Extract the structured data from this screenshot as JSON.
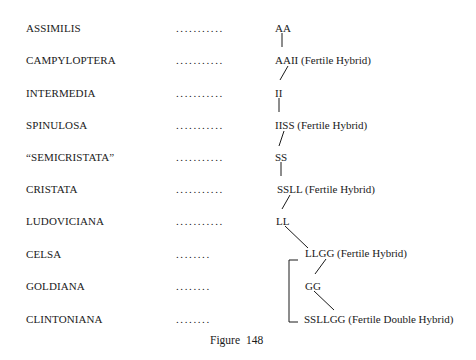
{
  "diagram": {
    "rows": [
      {
        "species": "ASSIMILIS",
        "dots": "...........",
        "genome": "AA"
      },
      {
        "species": "CAMPYLOPTERA",
        "dots": "...........",
        "genome": "AAII (Fertile Hybrid)"
      },
      {
        "species": "INTERMEDIA",
        "dots": "...........",
        "genome": "II"
      },
      {
        "species": "SPINULOSA",
        "dots": "...........",
        "genome": "IISS (Fertile Hybrid)"
      },
      {
        "species": "“SEMICRISTATA”",
        "dots": "...........",
        "genome": "SS"
      },
      {
        "species": "CRISTATA",
        "dots": "...........",
        "genome": "SSLL (Fertile Hybrid)"
      },
      {
        "species": "LUDOVICIANA",
        "dots": "...........",
        "genome": "LL"
      },
      {
        "species": "CELSA",
        "dots": "........",
        "genome": "LLGG (Fertile Hybrid)"
      },
      {
        "species": "GOLDIANA",
        "dots": "........",
        "genome": "GG"
      },
      {
        "species": "CLINTONIANA",
        "dots": "........",
        "genome": "SSLLGG (Fertile Double Hybrid)"
      }
    ],
    "caption": "Figure  148"
  }
}
